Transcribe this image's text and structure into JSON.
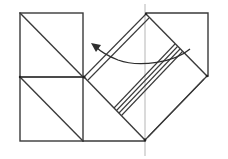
{
  "diagram": {
    "type": "origami-fold-step",
    "colors": {
      "line": "#3a3a3a",
      "guide": "#b5b5b5",
      "background": "#ffffff"
    },
    "left_squares": [
      {
        "name": "upper-left-square",
        "x": 20,
        "y": 13,
        "w": 63,
        "h": 64,
        "diagonal": "top-left-to-bottom-right"
      },
      {
        "name": "lower-left-square",
        "x": 20,
        "y": 77,
        "w": 63,
        "h": 64,
        "diagonal": "top-left-to-bottom-right"
      }
    ],
    "right_flap": {
      "corners": {
        "left": [
          84,
          77
        ],
        "top": [
          146,
          14
        ],
        "right": [
          207,
          76
        ],
        "bottom": [
          145,
          140
        ]
      },
      "back_square_corner_top_right": [
        208,
        13
      ],
      "layered_edges": [
        "upper-left-double",
        "lower-right-double",
        "center-multi-crease"
      ]
    },
    "guide_line": {
      "x": 145,
      "y1": 4,
      "y2": 156
    },
    "arrow": {
      "direction": "left",
      "meaning": "fold flap to the left"
    }
  }
}
